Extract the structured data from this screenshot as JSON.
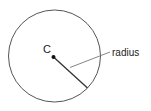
{
  "diagram": {
    "center_label": "C",
    "radius_label": "radius",
    "colors": {
      "circle_stroke": "#555555",
      "line_stroke": "#333333",
      "leader_stroke": "#777777",
      "text": "#222222",
      "background": "#ffffff"
    }
  }
}
